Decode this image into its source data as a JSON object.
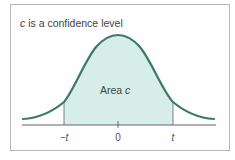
{
  "diagram": {
    "title_var": "c",
    "title_rest": " is a confidence level",
    "area_label_prefix": "Area ",
    "area_label_var": "c",
    "ticks": [
      {
        "label": "−t",
        "x": 64
      },
      {
        "label": "0",
        "x": 118
      },
      {
        "label": "t",
        "x": 173
      }
    ],
    "colors": {
      "curve": "#3a7a68",
      "fill": "#d6ede8",
      "axis": "#555555",
      "frame": "#b9b5b2"
    }
  }
}
